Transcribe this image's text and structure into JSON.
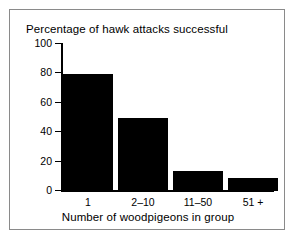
{
  "chart_data": {
    "type": "bar",
    "title": "Percentage of hawk attacks successful",
    "xlabel": "Number of woodpigeons in group",
    "ylabel": "",
    "categories": [
      "1",
      "2–10",
      "11–50",
      "51 +"
    ],
    "values": [
      79,
      49,
      13.5,
      8.5
    ],
    "ylim": [
      0,
      100
    ],
    "yticks": [
      0,
      20,
      40,
      60,
      80,
      100
    ],
    "ytick_labels": [
      "0",
      "20",
      "40",
      "60",
      "80",
      "100"
    ],
    "grid": false,
    "legend": null,
    "bar_color": "#000000",
    "axis_color": "#000000",
    "background_color": "#ffffff",
    "frame_color": "#8a8a8a"
  }
}
